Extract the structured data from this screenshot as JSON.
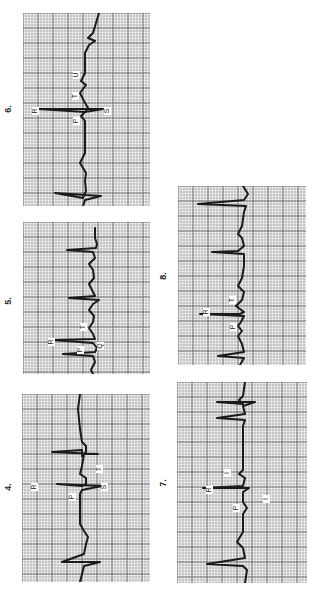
{
  "page": {
    "background": "#ffffff",
    "grid_color": "#8a8a8a",
    "grid_major_color": "#555555",
    "trace_color": "#1a1a1a"
  },
  "figures": [
    {
      "id": "6",
      "label": "6.",
      "box": {
        "x": 23,
        "y": 13,
        "w": 127,
        "h": 193
      },
      "label_pos": {
        "x": 4,
        "y": 104
      },
      "baseline_x": 62,
      "wave_labels": [
        {
          "text": "R",
          "x": 10,
          "y": 98
        },
        {
          "text": "P",
          "x": 51,
          "y": 108
        },
        {
          "text": "T",
          "x": 50,
          "y": 83
        },
        {
          "text": "U",
          "x": 51,
          "y": 62
        },
        {
          "text": "S",
          "x": 82,
          "y": 98
        }
      ],
      "path": "M76 0 L70 20 L65 25 L72 28 L66 32 L62 40 L62 60 L58 68 L63 72 L57 80 L61 88 L65 95 L62 99 L15 96 L80 96 L62 99 L58 103 L62 108 L62 140 L57 150 L63 160 L62 168 L63 178 L60 185 L32 180 L78 183 L62 187 L60 193"
    },
    {
      "id": "5",
      "label": "5.",
      "box": {
        "x": 23,
        "y": 222,
        "w": 127,
        "h": 152
      },
      "label_pos": {
        "x": 4,
        "y": 296
      },
      "baseline_x": 70,
      "wave_labels": [
        {
          "text": "R",
          "x": 26,
          "y": 120
        },
        {
          "text": "P",
          "x": 55,
          "y": 128
        },
        {
          "text": "T",
          "x": 58,
          "y": 105
        },
        {
          "text": "Q",
          "x": 75,
          "y": 124
        }
      ],
      "path": "M70 152 L68 148 L72 140 L70 134 L40 132 L72 130 L74 126 L70 121 L30 118 L72 117 L70 112 L66 106 L70 100 L71 94 L66 88 L70 82 L76 78 L46 76 L72 74 L70 70 L66 62 L71 56 L70 48 L66 42 L72 36 L70 30 L44 28 L73 26 L74 22 L72 16 L72 6"
    },
    {
      "id": "4",
      "label": "4.",
      "box": {
        "x": 22,
        "y": 394,
        "w": 128,
        "h": 188
      },
      "label_pos": {
        "x": 4,
        "y": 482
      },
      "baseline_x": 58,
      "wave_labels": [
        {
          "text": "R",
          "x": 10,
          "y": 93
        },
        {
          "text": "P",
          "x": 48,
          "y": 103
        },
        {
          "text": "T",
          "x": 75,
          "y": 75
        },
        {
          "text": "S",
          "x": 80,
          "y": 93
        }
      ],
      "path": "M58 0 L56 15 L58 35 L60 48 L64 52 L64 58 L60 62 L60 56 L30 58 L76 60 L62 60 L60 72 L58 80 L64 84 L64 90 L60 92 L35 90 L80 92 L60 96 L58 100 L58 130 L62 137 L66 143 L64 150 L62 160 L40 168 L78 168 L62 172 L58 188"
    },
    {
      "id": "8",
      "label": "8.",
      "box": {
        "x": 178,
        "y": 186,
        "w": 128,
        "h": 179
      },
      "label_pos": {
        "x": 159,
        "y": 271
      },
      "baseline_x": 65,
      "wave_labels": [
        {
          "text": "R",
          "x": 26,
          "y": 126
        },
        {
          "text": "P",
          "x": 53,
          "y": 141
        },
        {
          "text": "T",
          "x": 52,
          "y": 114
        }
      ],
      "path": "M65 0 L70 8 L66 14 L20 18 L68 20 L66 26 L64 40 L60 48 L64 52 L66 60 L60 65 L34 66 L66 68 L66 80 L64 92 L60 100 L66 106 L64 114 L58 120 L66 126 L62 128 L22 128 L66 130 L63 136 L60 140 L64 145 L60 150 L64 158 L66 166 L40 170 L66 172 L62 179"
    },
    {
      "id": "7",
      "label": "7.",
      "box": {
        "x": 177,
        "y": 382,
        "w": 130,
        "h": 201
      },
      "label_pos": {
        "x": 159,
        "y": 478
      },
      "baseline_x": 68,
      "wave_labels": [
        {
          "text": "R",
          "x": 30,
          "y": 108
        },
        {
          "text": "P",
          "x": 57,
          "y": 126
        },
        {
          "text": "I",
          "x": 48,
          "y": 91
        },
        {
          "text": "I",
          "x": 87,
          "y": 117
        }
      ],
      "path": "M68 0 L66 14 L62 18 L66 22 L40 20 L78 20 L66 24 L68 32 L40 36 L68 38 L66 44 L66 88 L62 92 L68 96 L66 104 L26 106 L72 106 L66 110 L66 120 L70 126 L66 132 L66 150 L60 160 L66 166 L68 176 L30 182 L66 184 L70 188 L68 201"
    }
  ]
}
